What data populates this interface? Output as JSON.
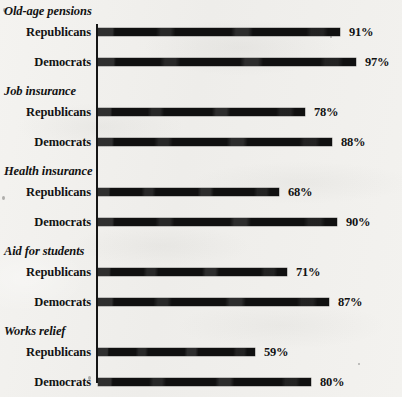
{
  "chart_data": {
    "type": "bar",
    "orientation": "horizontal",
    "title": "",
    "subtitle": "",
    "xlabel": "",
    "ylabel": "",
    "xlim": [
      0,
      100
    ],
    "grid": false,
    "legend_position": "none",
    "value_suffix": "%",
    "categories": [
      "Old-age pensions",
      "Job insurance",
      "Health insurance",
      "Aid for students",
      "Works relief"
    ],
    "series": [
      {
        "name": "Republicans",
        "values": [
          91,
          78,
          68,
          71,
          59
        ]
      },
      {
        "name": "Democrats",
        "values": [
          97,
          88,
          90,
          87,
          80
        ]
      }
    ],
    "groups": [
      {
        "label": "Old-age pensions",
        "rows": [
          {
            "label": "Republicans",
            "value": 91,
            "value_label": "91%"
          },
          {
            "label": "Democrats",
            "value": 97,
            "value_label": "97%"
          }
        ]
      },
      {
        "label": "Job insurance",
        "rows": [
          {
            "label": "Republicans",
            "value": 78,
            "value_label": "78%"
          },
          {
            "label": "Democrats",
            "value": 88,
            "value_label": "88%"
          }
        ]
      },
      {
        "label": "Health insurance",
        "rows": [
          {
            "label": "Republicans",
            "value": 68,
            "value_label": "68%"
          },
          {
            "label": "Democrats",
            "value": 90,
            "value_label": "90%"
          }
        ]
      },
      {
        "label": "Aid for students",
        "rows": [
          {
            "label": "Republicans",
            "value": 71,
            "value_label": "71%"
          },
          {
            "label": "Democrats",
            "value": 87,
            "value_label": "87%"
          }
        ]
      },
      {
        "label": "Works relief",
        "rows": [
          {
            "label": "Republicans",
            "value": 59,
            "value_label": "59%"
          },
          {
            "label": "Democrats",
            "value": 80,
            "value_label": "80%"
          }
        ]
      }
    ],
    "colors": {
      "bar": "#101010",
      "axis": "#151515",
      "text": "#121212",
      "background": "#f2f1ee"
    }
  }
}
